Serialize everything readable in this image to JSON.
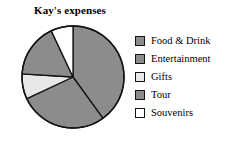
{
  "chart_data": {
    "type": "pie",
    "title": "Kay's expenses",
    "categories": [
      "Food & Drink",
      "Entertainment",
      "Gifts",
      "Tour",
      "Souvenirs"
    ],
    "values": [
      40,
      28,
      8,
      17,
      7
    ],
    "colors": [
      "#8c8c8c",
      "#8c8c8c",
      "#e8e8e8",
      "#8c8c8c",
      "#ffffff"
    ],
    "start_angle_deg": 0,
    "direction": "clockwise",
    "legend_position": "right",
    "grid": false,
    "xlabel": "",
    "ylabel": ""
  },
  "legend": {
    "items": [
      {
        "label": "Food & Drink",
        "color": "#8c8c8c",
        "swatch_name": "legend-swatch-food-drink"
      },
      {
        "label": "Entertainment",
        "color": "#8c8c8c",
        "swatch_name": "legend-swatch-entertainment"
      },
      {
        "label": "Gifts",
        "color": "#e8e8e8",
        "swatch_name": "legend-swatch-gifts"
      },
      {
        "label": "Tour",
        "color": "#8c8c8c",
        "swatch_name": "legend-swatch-tour"
      },
      {
        "label": "Souvenirs",
        "color": "#ffffff",
        "swatch_name": "legend-swatch-souvenirs"
      }
    ]
  },
  "style": {
    "outline": "#141414",
    "background": "#ffffff"
  }
}
